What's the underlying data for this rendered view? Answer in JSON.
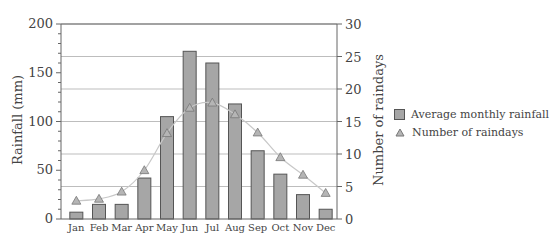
{
  "chart_data": {
    "type": "bar+line",
    "title": "",
    "categories": [
      "Jan",
      "Feb",
      "Mar",
      "Apr",
      "May",
      "Jun",
      "Jul",
      "Aug",
      "Sep",
      "Oct",
      "Nov",
      "Dec"
    ],
    "series": [
      {
        "name": "Average monthly rainfall",
        "type": "bar",
        "axis": "left",
        "values": [
          7,
          15,
          15,
          42,
          105,
          172,
          160,
          118,
          70,
          46,
          25,
          10
        ]
      },
      {
        "name": "Number of raindays",
        "type": "line",
        "marker": "triangle",
        "axis": "right",
        "values": [
          2.8,
          3.1,
          4.2,
          7.5,
          13.2,
          17.1,
          17.9,
          16.1,
          13.3,
          9.5,
          6.8,
          4.0
        ]
      }
    ],
    "ylabel": "Rainfall (mm)",
    "ylim": [
      0,
      200
    ],
    "yticks": [
      0,
      50,
      100,
      150,
      200
    ],
    "y2label": "Number of raindays",
    "y2lim": [
      0,
      30
    ],
    "y2ticks": [
      0,
      5,
      10,
      15,
      20,
      25,
      30
    ],
    "xlabel": "",
    "grid": "horizontal at right-axis major ticks",
    "legend_position": "right"
  },
  "legend": {
    "items": [
      {
        "label": "Average monthly rainfall",
        "symbol": "bar-swatch"
      },
      {
        "label": "Number of raindays",
        "symbol": "triangle"
      }
    ]
  },
  "colors": {
    "bar_fill": "#a6a6a6",
    "bar_stroke": "#555555",
    "line": "#c8c8c8",
    "marker_fill": "#b5b5b5",
    "marker_stroke": "#777777",
    "grid": "#bdbdbd",
    "axis": "#666666"
  }
}
